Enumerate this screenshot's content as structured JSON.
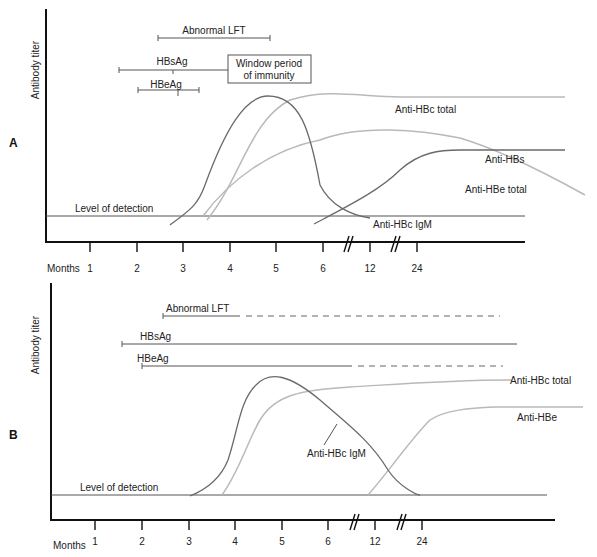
{
  "panels": [
    {
      "id": "A",
      "label": "A",
      "y_axis_label": "Antibody titer",
      "x_axis_label": "Months",
      "x_ticks": [
        "1",
        "2",
        "3",
        "4",
        "5",
        "6",
        "12",
        "24"
      ],
      "detection_label": "Level of detection",
      "bars": {
        "abnormal_lft": "Abnormal LFT",
        "hbsag": "HBsAg",
        "hbeag": "HBeAg"
      },
      "window_box": [
        "Window period",
        "of immunity"
      ],
      "curve_labels": {
        "anti_hbc_total": "Anti-HBc total",
        "anti_hbs": "Anti-HBs",
        "anti_hbe_total": "Anti-HBe total",
        "anti_hbc_igm": "Anti-HBc IgM"
      }
    },
    {
      "id": "B",
      "label": "B",
      "y_axis_label": "Antibody titer",
      "x_axis_label": "Months",
      "x_ticks": [
        "1",
        "2",
        "3",
        "4",
        "5",
        "6",
        "12",
        "24"
      ],
      "detection_label": "Level of detection",
      "bars": {
        "abnormal_lft": "Abnormal LFT",
        "hbsag": "HBsAg",
        "hbeag": "HBeAg"
      },
      "curve_labels": {
        "anti_hbc_total": "Anti-HBc total",
        "anti_hbe": "Anti-HBe",
        "anti_hbc_igm": "Anti-HBc IgM"
      }
    }
  ],
  "colors": {
    "axis": "#111111",
    "dark_curve": "#6a6a6a",
    "light_curve": "#b9b9b9"
  }
}
